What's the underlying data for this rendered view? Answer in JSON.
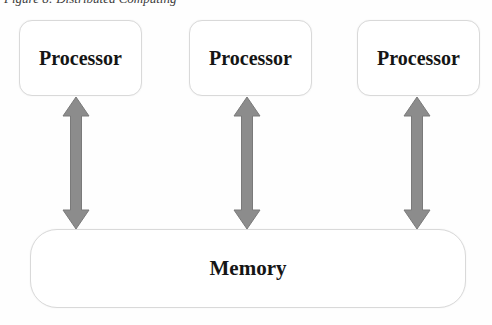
{
  "caption": "Figure 8: Distributed Computing",
  "diagram": {
    "processors": [
      {
        "label": "Processor"
      },
      {
        "label": "Processor"
      },
      {
        "label": "Processor"
      }
    ],
    "memory": {
      "label": "Memory"
    },
    "arrows": [
      {
        "name": "bidirectional-arrow",
        "connects": "Processor <-> Memory"
      },
      {
        "name": "bidirectional-arrow",
        "connects": "Processor <-> Memory"
      },
      {
        "name": "bidirectional-arrow",
        "connects": "Processor <-> Memory"
      }
    ],
    "colors": {
      "arrow_fill": "#8c8c8c",
      "arrow_edge": "#7a7a7a",
      "box_border": "#d9d9d9",
      "text": "#151515",
      "background": "#fefefe"
    }
  }
}
